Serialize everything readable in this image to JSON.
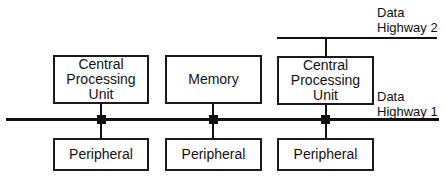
{
  "diagram": {
    "highways": [
      {
        "id": "highway-1",
        "label": "Data\nHighway 1"
      },
      {
        "id": "highway-2",
        "label": "Data\nHighway 2"
      }
    ],
    "upper_nodes": [
      {
        "label": "Central\nProcessing\nUnit"
      },
      {
        "label": "Memory"
      },
      {
        "label": "Central\nProcessing\nUnit"
      }
    ],
    "lower_nodes": [
      {
        "label": "Peripheral"
      },
      {
        "label": "Peripheral"
      },
      {
        "label": "Peripheral"
      }
    ],
    "connections": [
      {
        "from": "Central Processing Unit (1)",
        "to": "Data Highway 1"
      },
      {
        "from": "Memory",
        "to": "Data Highway 1"
      },
      {
        "from": "Central Processing Unit (2)",
        "to": "Data Highway 1"
      },
      {
        "from": "Central Processing Unit (2)",
        "to": "Data Highway 2"
      },
      {
        "from": "Peripheral (1)",
        "to": "Data Highway 1"
      },
      {
        "from": "Peripheral (2)",
        "to": "Data Highway 1"
      },
      {
        "from": "Peripheral (3)",
        "to": "Data Highway 1"
      }
    ]
  }
}
